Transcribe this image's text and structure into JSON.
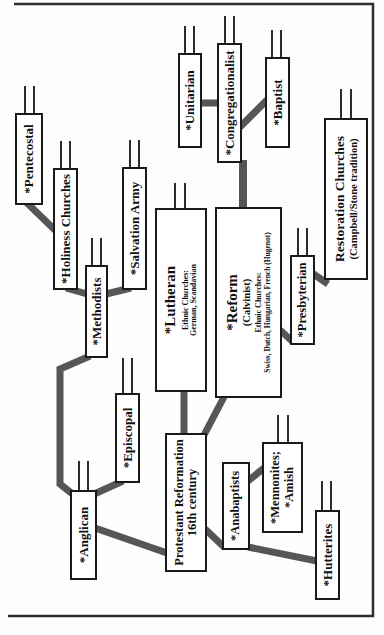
{
  "colors": {
    "connector": "#565656",
    "stub": "#2b2b2b",
    "box_border": "#1a1a1a",
    "box_fill": "#ffffff",
    "frame": "#2e2e2e",
    "background": "#fdfdfd",
    "text": "#111111"
  },
  "nodes": {
    "pentecostal": {
      "label": "*Pentecostal"
    },
    "holiness_churches": {
      "label": "*Holiness Churches"
    },
    "methodists": {
      "label": "*Methodists"
    },
    "salvation_army": {
      "label": "*Salvation Army"
    },
    "unitarian": {
      "label": "*Unitarian"
    },
    "congregationalist": {
      "label": "*Congregationalist"
    },
    "baptist": {
      "label": "*Baptist"
    },
    "restoration_churches": {
      "title": "Restoration Churches",
      "subtitle": "(Campbell/Stone tradition)"
    },
    "lutheran": {
      "title": "*Lutheran",
      "sub1": "Ethnic Churches:",
      "sub2": "German, Scandavian"
    },
    "reform": {
      "title": "*Reform",
      "subtitle": "(Calvinist)",
      "sub1": "Ethnic Churches:",
      "sub2": "Swiss, Dutch, Hungarian, French (Hugenot)"
    },
    "presbyterian": {
      "label": "*Presbyterian"
    },
    "episcopal": {
      "label": "*Episcopal"
    },
    "anglican": {
      "label": "*Anglican"
    },
    "protestant_reformation": {
      "title": "Protestant Reformation",
      "subtitle": "16th century"
    },
    "anabaptists": {
      "label": "*Anabaptists"
    },
    "mennonites_amish": {
      "line1": "*Mennonites;",
      "line2": "*Amish"
    },
    "hutterites": {
      "label": "*Hutterites"
    }
  }
}
